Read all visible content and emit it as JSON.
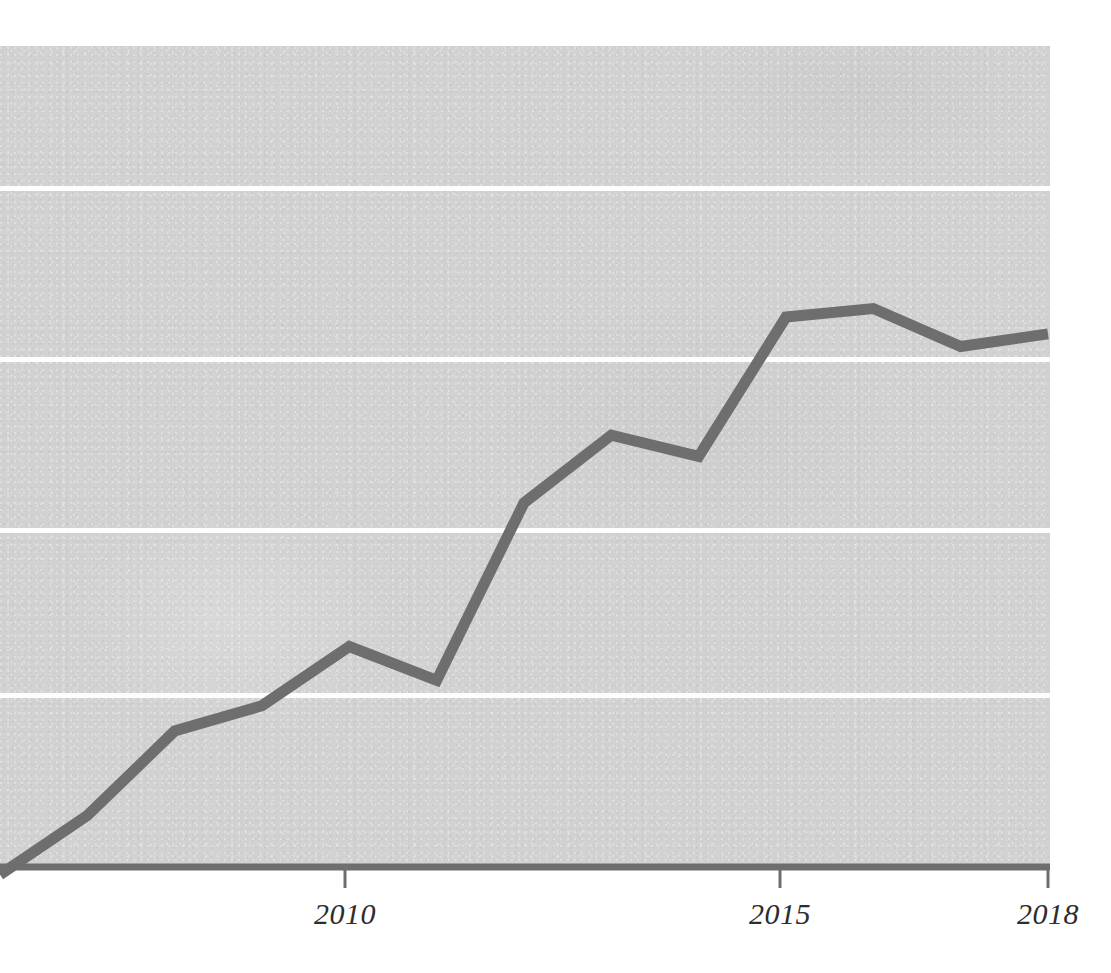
{
  "chart_data": {
    "type": "line",
    "title": "",
    "subtitle": "",
    "xlabel": "",
    "ylabel": "",
    "x": [
      2006,
      2007,
      2008,
      2009,
      2010,
      2011,
      2012,
      2013,
      2014,
      2015,
      2016,
      2017,
      2018
    ],
    "series": [
      {
        "name": "series-1",
        "color": "#6e6e6e",
        "values": [
          18.5,
          25.5,
          35.5,
          38.5,
          45.5,
          41.5,
          62.5,
          70.5,
          68.0,
          84.5,
          85.5,
          81.0,
          82.5
        ]
      }
    ],
    "x_tick_values": [
      2010,
      2015,
      2018
    ],
    "x_tick_labels": [
      "2010",
      "2015",
      "2018"
    ],
    "y_gridline_values": [
      100,
      80,
      60,
      40
    ],
    "y_tick_labels": [],
    "xlim": [
      2006,
      2018
    ],
    "ylim": [
      0,
      120
    ],
    "grid": "horizontal-only",
    "legend": "none",
    "annotations": []
  },
  "axes": {
    "x_axis_color": "#6e6e6e",
    "gridline_color": "#fdfdfd",
    "plot_background": "#d2d2d2",
    "page_background": "#ffffff"
  },
  "ticks": [
    {
      "label": "2010",
      "x_px": 345
    },
    {
      "label": "2015",
      "x_px": 780
    },
    {
      "label": "2018",
      "x_px": 1048
    }
  ]
}
